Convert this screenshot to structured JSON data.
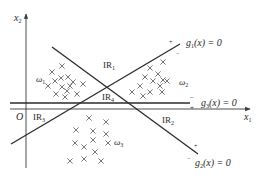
{
  "diagram": {
    "axes": {
      "x_label": "x",
      "x_sub": "1",
      "y_label": "x",
      "y_sub": "2",
      "origin_label": "O"
    },
    "boundaries": [
      {
        "id": "g1",
        "label_fn": "g",
        "label_sub": "1",
        "label_rest": "(x) = 0",
        "pos_sign": "+",
        "neg_sign": "−"
      },
      {
        "id": "g2",
        "label_fn": "g",
        "label_sub": "2",
        "label_rest": "(x) = 0",
        "pos_sign": "+",
        "neg_sign": "−"
      },
      {
        "id": "g3",
        "label_fn": "g",
        "label_sub": "3",
        "label_rest": "(x) = 0",
        "pos_sign": "+",
        "neg_sign": "−"
      }
    ],
    "regions": [
      {
        "id": "IR1",
        "label": "IR",
        "sub": "1"
      },
      {
        "id": "IR2",
        "label": "IR",
        "sub": "2"
      },
      {
        "id": "IR3",
        "label": "IR",
        "sub": "3"
      },
      {
        "id": "IR4",
        "label": "IR",
        "sub": "4"
      }
    ],
    "classes": [
      {
        "id": "w1",
        "label": "ω",
        "sub": "1"
      },
      {
        "id": "w2",
        "label": "ω",
        "sub": "2"
      },
      {
        "id": "w3",
        "label": "ω",
        "sub": "3"
      }
    ],
    "sample_marker": "×"
  }
}
